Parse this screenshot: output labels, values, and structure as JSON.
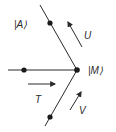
{
  "diagram": {
    "colors": {
      "line": "#2a2a2a",
      "background": "#ffffff"
    },
    "vertex": {
      "label": "|M⟩",
      "x": 77,
      "y": 70
    },
    "branches": [
      {
        "name": "upper",
        "from": [
          40,
          5
        ],
        "to": [
          77,
          70
        ],
        "dot": [
          50,
          23
        ],
        "label": "|A⟩",
        "label_pos": [
          14,
          28
        ]
      },
      {
        "name": "left",
        "from": [
          8,
          70
        ],
        "to": [
          77,
          70
        ],
        "dot": [
          24,
          70
        ]
      },
      {
        "name": "lower",
        "from": [
          77,
          70
        ],
        "to": [
          45,
          126
        ],
        "dot": [
          50,
          117
        ]
      }
    ],
    "arrows": [
      {
        "label": "U",
        "from": [
          82,
          47
        ],
        "to": [
          68,
          22
        ],
        "label_pos": [
          84,
          39
        ]
      },
      {
        "label": "T",
        "from": [
          28,
          84
        ],
        "to": [
          55,
          84
        ],
        "label_pos": [
          35,
          103
        ]
      },
      {
        "label": "V",
        "from": [
          70,
          110
        ],
        "to": [
          81,
          92
        ],
        "label_pos": [
          79,
          114
        ]
      }
    ]
  }
}
